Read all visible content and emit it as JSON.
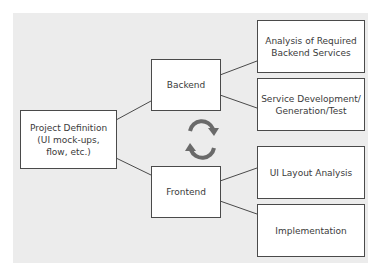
{
  "diagram": {
    "type": "flow-tree",
    "nodes": {
      "root": {
        "label": "Project Definition\n(UI mock-ups,\nflow, etc.)"
      },
      "backend": {
        "label": "Backend"
      },
      "frontend": {
        "label": "Frontend"
      },
      "backend_children": [
        {
          "label": "Analysis of Required\nBackend Services"
        },
        {
          "label": "Service Development/\nGeneration/Test"
        }
      ],
      "frontend_children": [
        {
          "label": "UI Layout Analysis"
        },
        {
          "label": "Implementation"
        }
      ]
    },
    "edges": [
      [
        "root",
        "backend"
      ],
      [
        "root",
        "frontend"
      ],
      [
        "backend",
        "backend_children.0"
      ],
      [
        "backend",
        "backend_children.1"
      ],
      [
        "frontend",
        "frontend_children.0"
      ],
      [
        "frontend",
        "frontend_children.1"
      ]
    ],
    "center_icon": "cycle-arrows-icon",
    "colors": {
      "panel_background": "#ececec",
      "box_fill": "#ffffff",
      "box_border": "#4a4a4a",
      "text": "#3a3a3a",
      "cycle_arrows": "#6a6a6a"
    }
  }
}
